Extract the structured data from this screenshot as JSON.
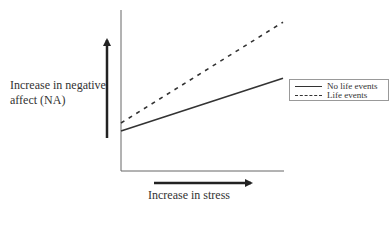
{
  "labels": {
    "y_axis": "Increase in negative affect (NA)",
    "y_axis_line1": "Increase in negative",
    "y_axis_line2": "affect (NA)",
    "x_axis": "Increase in stress"
  },
  "legend": {
    "items": [
      {
        "label": "No life events",
        "style": "solid"
      },
      {
        "label": "Life events",
        "style": "dashed"
      }
    ]
  },
  "colors": {
    "line": "#333333",
    "axis": "#666666",
    "legend_border": "#999999"
  },
  "chart_data": {
    "type": "line",
    "title": "",
    "xlabel": "Increase in stress",
    "ylabel": "Increase in negative affect (NA)",
    "x": [
      0,
      1
    ],
    "series": [
      {
        "name": "No life events",
        "style": "solid",
        "values": [
          0.25,
          0.58
        ]
      },
      {
        "name": "Life events",
        "style": "dashed",
        "values": [
          0.3,
          0.93
        ]
      }
    ],
    "xlim": [
      0,
      1
    ],
    "ylim": [
      0,
      1
    ],
    "grid": false,
    "legend_position": "right",
    "tick_labels": "none"
  }
}
